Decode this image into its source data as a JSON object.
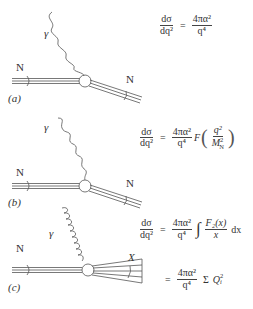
{
  "panels": [
    {
      "id": "a",
      "label": "(a)",
      "incoming": "N",
      "boson": "γ",
      "outgoing": "N",
      "boson_style": "wavy",
      "equation": {
        "lhs_num": "dσ",
        "lhs_den": "dq²",
        "eq": "=",
        "rhs_num": "4πα²",
        "rhs_den": "q⁴"
      }
    },
    {
      "id": "b",
      "label": "(b)",
      "incoming": "N",
      "boson": "γ",
      "outgoing": "N",
      "boson_style": "wavy",
      "equation": {
        "lhs_num": "dσ",
        "lhs_den": "dq²",
        "eq": "=",
        "rhs_num": "4πα²",
        "rhs_den": "q⁴",
        "func": "F",
        "arg_num": "q²",
        "arg_den_base": "M",
        "arg_den_sup": "2",
        "arg_den_sub": "N"
      }
    },
    {
      "id": "c",
      "label": "(c)",
      "incoming": "N",
      "boson": "γ",
      "outgoing": "X",
      "boson_style": "coiled",
      "equation": {
        "lhs_num": "dσ",
        "lhs_den": "dq²",
        "eq": "=",
        "rhs_num": "4πα²",
        "rhs_den": "q⁴",
        "integral": "∫",
        "int_num": "F₂(x)",
        "int_den": "x",
        "dx": "dx"
      },
      "equation2": {
        "eq": "=",
        "rhs_num": "4πα²",
        "rhs_den": "q⁴",
        "sum": "Σ",
        "q_base": "Q",
        "q_sup": "2",
        "q_sub": "i"
      }
    }
  ],
  "colors": {
    "line": "#555555",
    "text": "#333333",
    "background": "#ffffff"
  }
}
